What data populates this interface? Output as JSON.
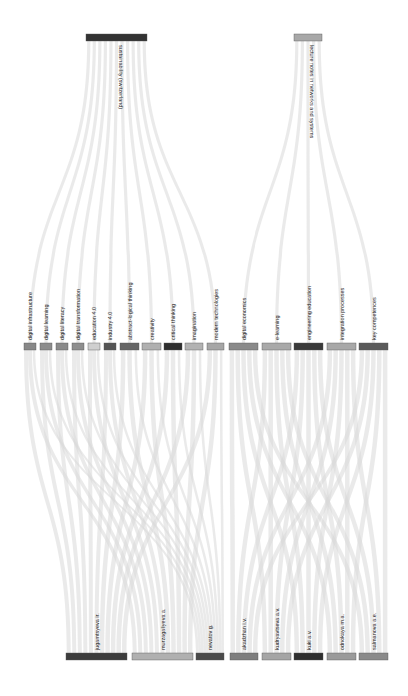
{
  "chart_data": {
    "type": "sankey",
    "orientation": "vertical",
    "title": "",
    "levels": [
      {
        "name": "sources",
        "nodes": [
          {
            "id": "sustainability",
            "label": "sustainability (switzerland)",
            "color": "#333333",
            "x": 86,
            "w": 61
          },
          {
            "id": "lecture_notes",
            "label": "lecture notes in networks and systems",
            "color": "#a8a8a8",
            "x": 294,
            "w": 28
          }
        ]
      },
      {
        "name": "keywords",
        "nodes": [
          {
            "id": "k1",
            "label": "digital infrastructure",
            "color": "#888888",
            "x": 24,
            "w": 12
          },
          {
            "id": "k2",
            "label": "digital learning",
            "color": "#8c8c8c",
            "x": 40,
            "w": 12
          },
          {
            "id": "k3",
            "label": "digital literacy",
            "color": "#8a8a8a",
            "x": 56,
            "w": 12
          },
          {
            "id": "k4",
            "label": "digital transformation",
            "color": "#8e8e8e",
            "x": 72,
            "w": 12
          },
          {
            "id": "k5",
            "label": "education 4.0",
            "color": "#cfcfcf",
            "x": 88,
            "w": 12
          },
          {
            "id": "k6",
            "label": "industry 4.0",
            "color": "#555555",
            "x": 104,
            "w": 12
          },
          {
            "id": "k7",
            "label": "abstract-logical thinking",
            "color": "#666666",
            "x": 120,
            "w": 19
          },
          {
            "id": "k8",
            "label": "creativity",
            "color": "#b0b0b0",
            "x": 142,
            "w": 19
          },
          {
            "id": "k9",
            "label": "critical thinking",
            "color": "#2e2e2e",
            "x": 164,
            "w": 18
          },
          {
            "id": "k10",
            "label": "imagination",
            "color": "#b2b2b2",
            "x": 185,
            "w": 18
          },
          {
            "id": "k11",
            "label": "modern technologies",
            "color": "#a6a6a6",
            "x": 207,
            "w": 17
          },
          {
            "id": "k12",
            "label": "digital economics",
            "color": "#8a8a8a",
            "x": 229,
            "w": 29
          },
          {
            "id": "k13",
            "label": "e-learning",
            "color": "#a9a9a9",
            "x": 262,
            "w": 29
          },
          {
            "id": "k14",
            "label": "engineering education",
            "color": "#3a3a3a",
            "x": 294,
            "w": 29
          },
          {
            "id": "k15",
            "label": "integration processes",
            "color": "#a8a8a8",
            "x": 327,
            "w": 29
          },
          {
            "id": "k16",
            "label": "key competences",
            "color": "#5a5a5a",
            "x": 359,
            "w": 29
          }
        ]
      },
      {
        "name": "authors",
        "nodes": [
          {
            "id": "a1",
            "label": "jugamtsyeva ir.",
            "color": "#3c3c3c",
            "x": 66,
            "w": 61
          },
          {
            "id": "a2",
            "label": "murzagaliyeva a.",
            "color": "#b0b0b0",
            "x": 132,
            "w": 61
          },
          {
            "id": "a3",
            "label": "nevatov g.",
            "color": "#4a4a4a",
            "x": 196,
            "w": 28
          },
          {
            "id": "a4",
            "label": "akadzhan i.v.",
            "color": "#7e7e7e",
            "x": 230,
            "w": 28
          },
          {
            "id": "a5",
            "label": "kudryavtseva a.v.",
            "color": "#a5a5a5",
            "x": 262,
            "w": 29
          },
          {
            "id": "a6",
            "label": "kuki a.v.",
            "color": "#2f2f2f",
            "x": 294,
            "w": 29
          },
          {
            "id": "a7",
            "label": "odnokaya m.a.",
            "color": "#9a9a9a",
            "x": 327,
            "w": 29
          },
          {
            "id": "a8",
            "label": "salmanova a.e.",
            "color": "#8a8a8a",
            "x": 359,
            "w": 29
          }
        ]
      }
    ],
    "links_top": [
      {
        "source": "sustainability",
        "target": "k1",
        "value": 1
      },
      {
        "source": "sustainability",
        "target": "k2",
        "value": 1
      },
      {
        "source": "sustainability",
        "target": "k3",
        "value": 1
      },
      {
        "source": "sustainability",
        "target": "k4",
        "value": 1
      },
      {
        "source": "sustainability",
        "target": "k5",
        "value": 1
      },
      {
        "source": "sustainability",
        "target": "k6",
        "value": 1
      },
      {
        "source": "sustainability",
        "target": "k7",
        "value": 1
      },
      {
        "source": "sustainability",
        "target": "k8",
        "value": 1
      },
      {
        "source": "sustainability",
        "target": "k9",
        "value": 1
      },
      {
        "source": "sustainability",
        "target": "k10",
        "value": 1
      },
      {
        "source": "sustainability",
        "target": "k11",
        "value": 1
      },
      {
        "source": "lecture_notes",
        "target": "k12",
        "value": 1
      },
      {
        "source": "lecture_notes",
        "target": "k13",
        "value": 1
      },
      {
        "source": "lecture_notes",
        "target": "k14",
        "value": 1
      },
      {
        "source": "lecture_notes",
        "target": "k15",
        "value": 1
      },
      {
        "source": "lecture_notes",
        "target": "k16",
        "value": 1
      }
    ],
    "links_bottom_note": "Each keyword connects to authors of its source group: sustainability keywords (k1-k11) fan out to jugamtsyeva, murzagaliyeva, nevatov; lecture-notes keywords (k12-k16) fan out to all five of akadzhan, kudryavtseva, kuki, odnokaya, salmanova.",
    "link_color": "#d9d9d9",
    "link_opacity": 0.55
  }
}
